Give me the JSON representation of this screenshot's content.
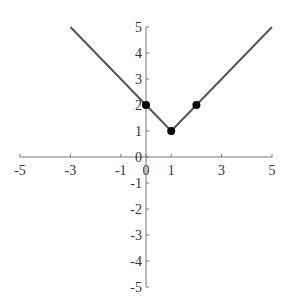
{
  "chart_data": {
    "type": "line",
    "title": "",
    "xlabel": "",
    "ylabel": "",
    "xlim": [
      -5,
      5
    ],
    "ylim": [
      -5,
      5
    ],
    "grid": false,
    "legend": null,
    "x_ticks": [
      -5,
      -3,
      -1,
      0,
      1,
      3,
      5
    ],
    "x_tick_labels": [
      "-5",
      "-3",
      "-1",
      "0",
      "1",
      "3",
      "5"
    ],
    "y_ticks": [
      -5,
      -4,
      -3,
      -2,
      -1,
      0,
      1,
      2,
      3,
      4,
      5
    ],
    "y_tick_labels": [
      "-5",
      "-4",
      "-3",
      "-2",
      "-1",
      "0",
      "1",
      "2",
      "3",
      "4",
      "5"
    ],
    "series": [
      {
        "name": "y = |x - 1| + 1",
        "x": [
          -3,
          1,
          5
        ],
        "y": [
          5,
          1,
          5
        ],
        "color": "#555555"
      }
    ],
    "points": [
      {
        "x": 0,
        "y": 2
      },
      {
        "x": 1,
        "y": 1
      },
      {
        "x": 2,
        "y": 2
      }
    ],
    "point_color": "#000000"
  }
}
